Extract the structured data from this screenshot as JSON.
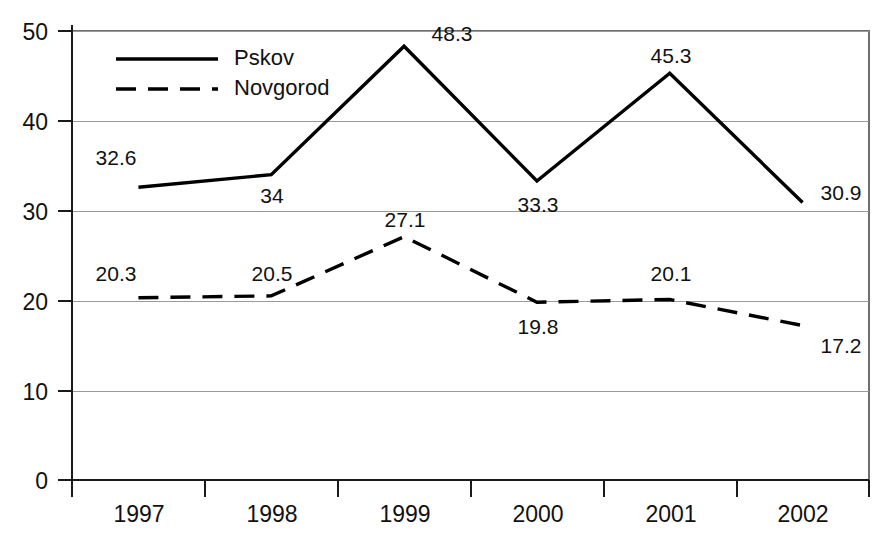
{
  "chart_data": {
    "type": "line",
    "title": "",
    "xlabel": "",
    "ylabel": "",
    "categories": [
      "1997",
      "1998",
      "1999",
      "2000",
      "2001",
      "2002"
    ],
    "series": [
      {
        "name": "Pskov",
        "style": "solid",
        "color": "#000000",
        "values": [
          32.6,
          34,
          48.3,
          33.3,
          45.3,
          30.9
        ],
        "labels": [
          "32.6",
          "34",
          "48.3",
          "33.3",
          "45.3",
          "30.9"
        ]
      },
      {
        "name": "Novgorod",
        "style": "dashed",
        "color": "#000000",
        "values": [
          20.3,
          20.5,
          27.1,
          19.8,
          20.1,
          17.2
        ],
        "labels": [
          "20.3",
          "20.5",
          "27.1",
          "19.8",
          "20.1",
          "17.2"
        ]
      }
    ],
    "ylim": [
      0,
      50
    ],
    "yticks": [
      0,
      10,
      20,
      30,
      40,
      50
    ],
    "ytick_labels": [
      "0",
      "10",
      "20",
      "30",
      "40",
      "50"
    ],
    "grid": true,
    "legend_position": "upper-left-inside"
  },
  "legend": {
    "entries": [
      {
        "label": "Pskov"
      },
      {
        "label": "Novgorod"
      }
    ]
  },
  "axes": {
    "y_tick_labels": [
      "50",
      "40",
      "30",
      "20",
      "10",
      "0"
    ],
    "x_tick_labels": [
      "1997",
      "1998",
      "1999",
      "2000",
      "2001",
      "2002"
    ]
  },
  "value_labels": {
    "pskov": {
      "1997": "32.6",
      "1998": "34",
      "1999": "48.3",
      "2000": "33.3",
      "2001": "45.3",
      "2002": "30.9"
    },
    "novgorod": {
      "1997": "20.3",
      "1998": "20.5",
      "1999": "27.1",
      "2000": "19.8",
      "2001": "20.1",
      "2002": "17.2"
    }
  }
}
